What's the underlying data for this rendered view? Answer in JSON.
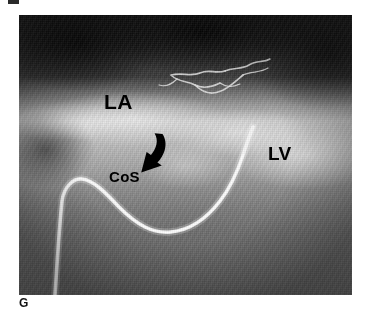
{
  "figure": {
    "panel_letter": "G",
    "modality": "angiogram",
    "top_clipped_mark": ""
  },
  "image": {
    "frame": {
      "left_px": 19,
      "top_px": 15,
      "width_px": 333,
      "height_px": 280
    },
    "background_color": "#5a5a5a",
    "dark_tone_color": "#1b1b1b",
    "bright_tone_color": "#c8c8c8"
  },
  "annotations": [
    {
      "id": "la",
      "label": "LA",
      "meaning": "left atrium",
      "color": "#000000",
      "x_px": 104,
      "y_px": 91,
      "font_size_px": 21
    },
    {
      "id": "lv",
      "label": "LV",
      "meaning": "left ventricle",
      "color": "#000000",
      "x_px": 268,
      "y_px": 144,
      "font_size_px": 19
    },
    {
      "id": "cos",
      "label": "CoS",
      "meaning": "coronary sinus",
      "color": "#000000",
      "x_px": 109,
      "y_px": 169,
      "font_size_px": 15
    }
  ],
  "arrow": {
    "id": "pointer-arrow",
    "color": "#000000",
    "points_to": "CoS",
    "direction": "down-left",
    "x_px": 128,
    "y_px": 132
  },
  "catheter": {
    "id": "catheter",
    "color": "#f2f2f2",
    "shape": "U-curve",
    "description": "bright radiopaque catheter entering lower left, hooking at upper left then sweeping down and to the upper right"
  },
  "vessels": {
    "color": "#e8e8e8",
    "description": "thin branching opacified vessels in upper middle field"
  }
}
